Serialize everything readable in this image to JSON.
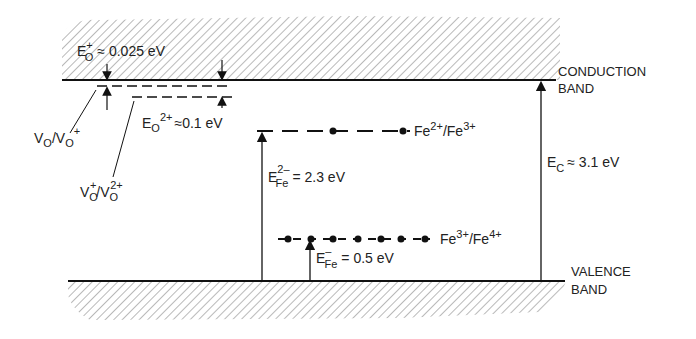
{
  "diagram": {
    "type": "energy-band-diagram",
    "bands": {
      "conduction": {
        "label_line1": "CONDUCTION",
        "label_line2": "BAND"
      },
      "valence": {
        "label_line1": "VALENCE",
        "label_line2": "BAND"
      }
    },
    "gap": {
      "symbol": "E",
      "sub": "C",
      "value": "≈ 3.1 eV"
    },
    "levels": [
      {
        "id": "fe2-fe3",
        "label_a": "Fe",
        "sup_a": "2+",
        "sep": "/",
        "label_b": "Fe",
        "sup_b": "3+",
        "energy_symbol": "E",
        "energy_sup": "2–",
        "energy_sub": "Fe",
        "energy_value": "= 2.3 eV"
      },
      {
        "id": "fe3-fe4",
        "label_a": "Fe",
        "sup_a": "3+",
        "sep": "/",
        "label_b": "Fe",
        "sup_b": "4+",
        "energy_symbol": "E",
        "energy_sup": "–",
        "energy_sub": "Fe",
        "energy_value": "= 0.5 eV"
      },
      {
        "id": "vo-vo+",
        "label_a": "V",
        "sub_a": "O",
        "sep": "/",
        "label_b": "V",
        "sub_b": "O",
        "sup_b": "+",
        "energy_symbol": "E",
        "energy_sub": "O",
        "energy_sup": "+",
        "energy_value": "≈ 0.025 eV"
      },
      {
        "id": "vo+-vo2+",
        "label_a": "V",
        "sub_a": "O",
        "sup_a": "+",
        "sep": "/",
        "label_b": "V",
        "sub_b": "O",
        "sup_b": "2+",
        "energy_symbol": "E",
        "energy_sub": "O",
        "energy_sup": "2+",
        "energy_value": "≈0.1 eV"
      }
    ]
  }
}
